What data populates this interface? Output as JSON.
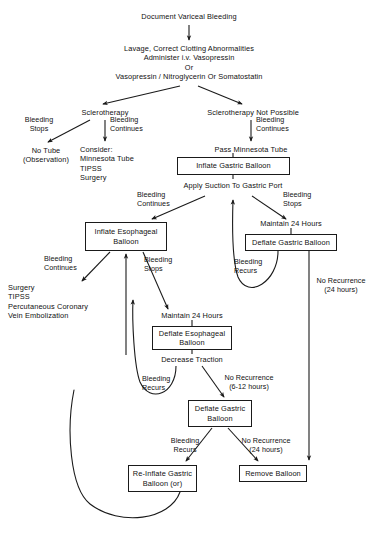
{
  "diagram": {
    "type": "flowchart",
    "nodes": [
      {
        "id": "document",
        "label": "Document Variceal Bleeding",
        "boxed": false
      },
      {
        "id": "lavage",
        "label": "Lavage, Correct Clotting Abnormalities\nAdminister i.v. Vasopressin\nOr\nVasopressin / Nitroglycerin Or Somatostatin",
        "boxed": false
      },
      {
        "id": "sclerotherapy",
        "label": "Sclerotherapy",
        "boxed": false
      },
      {
        "id": "scleroNotPossible",
        "label": "Sclerotherapy Not Possible",
        "boxed": false
      },
      {
        "id": "noTube",
        "label": "No Tube\n(Observation)",
        "boxed": false
      },
      {
        "id": "consider",
        "label": "Consider:\n   Minnesota Tube\n   TIPSS\n   Surgery",
        "boxed": false
      },
      {
        "id": "passMinnesota",
        "label": "Pass Minnesota Tube",
        "boxed": false
      },
      {
        "id": "inflateGastric",
        "label": "Inflate Gastric Balloon",
        "boxed": true
      },
      {
        "id": "applySuction",
        "label": "Apply Suction To Gastric Port",
        "boxed": false
      },
      {
        "id": "inflateEsophageal",
        "label": "Inflate Esophageal\nBalloon",
        "boxed": true
      },
      {
        "id": "maintain24a",
        "label": "Maintain 24 Hours",
        "boxed": false
      },
      {
        "id": "deflateGastric1",
        "label": "Deflate Gastric Balloon",
        "boxed": true
      },
      {
        "id": "surgeryList",
        "label": "Surgery\nTIPSS\nPercutaneous Coronary\n   Vein Embolization",
        "boxed": false
      },
      {
        "id": "maintain24b",
        "label": "Maintain 24 Hours",
        "boxed": false
      },
      {
        "id": "deflateEsophageal",
        "label": "Deflate Esophageal\nBalloon",
        "boxed": true
      },
      {
        "id": "decreaseTraction",
        "label": "Decrease Traction",
        "boxed": false
      },
      {
        "id": "deflateGastric2",
        "label": "Deflate Gastric\nBalloon",
        "boxed": true
      },
      {
        "id": "reInflateGastric",
        "label": "Re-Inflate Gastric\nBalloon (or)",
        "boxed": true
      },
      {
        "id": "removeBalloon",
        "label": "Remove Balloon",
        "boxed": true
      }
    ],
    "edge_labels": [
      {
        "id": "bleedingStops1",
        "text": "Bleeding\nStops"
      },
      {
        "id": "bleedingContinues1",
        "text": "Bleeding\nContinues"
      },
      {
        "id": "bleedingContinues2",
        "text": "Bleeding\nContinues"
      },
      {
        "id": "bleedingContinues3",
        "text": "Bleeding\nContinues"
      },
      {
        "id": "bleedingStops2",
        "text": "Bleeding\nStops"
      },
      {
        "id": "bleedingContinues4",
        "text": "Bleeding\nContinues"
      },
      {
        "id": "bleedingStops3",
        "text": "Bleeding\nStops"
      },
      {
        "id": "bleedingRecurs1",
        "text": "Bleeding\nRecurs"
      },
      {
        "id": "noRecurrence24a",
        "text": "No Recurrence\n(24 hours)"
      },
      {
        "id": "bleedingRecurs2",
        "text": "Bleeding\nRecurs"
      },
      {
        "id": "noRecurrence612",
        "text": "No Recurrence\n(6-12 hours)"
      },
      {
        "id": "bleedingRecurs3",
        "text": "Bleeding\nRecurs"
      },
      {
        "id": "noRecurrence24b",
        "text": "No Recurrence\n(24 hours)"
      }
    ]
  },
  "colors": {
    "ink": "#111111",
    "stroke": "#1a1a1a",
    "background": "#ffffff"
  }
}
